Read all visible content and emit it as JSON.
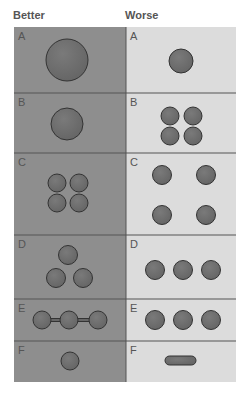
{
  "headers": {
    "better": "Better",
    "worse": "Worse"
  },
  "colors": {
    "better_bg": "#8e8e8e",
    "worse_bg": "#dcdcdc",
    "grid": "#555555",
    "shape_fill": "#666666",
    "shape_stroke": "#333333",
    "label": "#555555"
  },
  "table": {
    "x": 14,
    "y": 27,
    "width": 222,
    "divider_x": 126
  },
  "rows": [
    {
      "label": "A",
      "y0": 27,
      "y1": 93,
      "better": {
        "circles": [
          [
            67,
            60,
            21
          ]
        ]
      },
      "worse": {
        "circles": [
          [
            181,
            61,
            12
          ]
        ]
      }
    },
    {
      "label": "B",
      "y0": 93,
      "y1": 153,
      "better": {
        "circles": [
          [
            67,
            124,
            16
          ]
        ]
      },
      "worse": {
        "circles": [
          [
            170,
            116,
            9
          ],
          [
            193,
            116,
            9
          ],
          [
            170,
            136,
            9
          ],
          [
            193,
            136,
            9
          ]
        ]
      }
    },
    {
      "label": "C",
      "y0": 153,
      "y1": 235,
      "better": {
        "circles": [
          [
            57,
            183,
            9
          ],
          [
            79,
            183,
            9
          ],
          [
            57,
            203,
            9
          ],
          [
            79,
            203,
            9
          ]
        ]
      },
      "worse": {
        "circles": [
          [
            162,
            175,
            9.5
          ],
          [
            206,
            175,
            9.5
          ],
          [
            162,
            215,
            9.5
          ],
          [
            206,
            215,
            9.5
          ]
        ]
      }
    },
    {
      "label": "D",
      "y0": 235,
      "y1": 299,
      "better": {
        "circles": [
          [
            68,
            255,
            9.5
          ],
          [
            56,
            278,
            9.5
          ],
          [
            83,
            278,
            9.5
          ]
        ]
      },
      "worse": {
        "circles": [
          [
            155,
            270,
            9.5
          ],
          [
            183,
            270,
            9.5
          ],
          [
            211,
            270,
            9.5
          ]
        ]
      }
    },
    {
      "label": "E",
      "y0": 299,
      "y1": 341,
      "better": {
        "circles": [
          [
            42,
            320,
            9
          ],
          [
            69,
            320,
            9
          ],
          [
            98,
            320,
            9
          ]
        ],
        "bars": [
          [
            42,
            98,
            320,
            3
          ]
        ]
      },
      "worse": {
        "circles": [
          [
            155,
            320,
            9.5
          ],
          [
            183,
            320,
            9.5
          ],
          [
            211,
            320,
            9.5
          ]
        ]
      }
    },
    {
      "label": "F",
      "y0": 341,
      "y1": 382,
      "better": {
        "circles": [
          [
            70,
            361,
            9
          ]
        ]
      },
      "worse": {
        "pills": [
          [
            165,
            356,
            31,
            9
          ]
        ]
      }
    }
  ]
}
